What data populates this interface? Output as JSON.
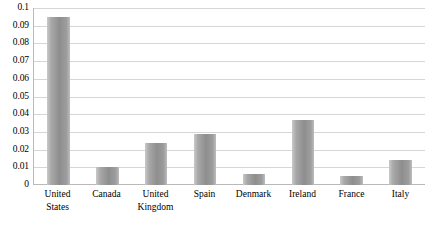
{
  "chart_data": {
    "type": "bar",
    "title": "",
    "subtitle": "",
    "xlabel": "",
    "ylabel": "",
    "categories": [
      "United States",
      "Canada",
      "United Kingdom",
      "Spain",
      "Denmark",
      "Ireland",
      "France",
      "Italy"
    ],
    "values": [
      0.095,
      0.01,
      0.024,
      0.029,
      0.006,
      0.037,
      0.005,
      0.014
    ],
    "series": [
      {
        "name": "Value",
        "values": [
          0.095,
          0.01,
          0.024,
          0.029,
          0.006,
          0.037,
          0.005,
          0.014
        ]
      }
    ],
    "ylim": [
      0,
      0.1
    ],
    "ytick_values": [
      0,
      0.01,
      0.02,
      0.03,
      0.04,
      0.05,
      0.06,
      0.07,
      0.08,
      0.09,
      0.1
    ],
    "ytick_labels": [
      "0",
      "0.01",
      "0.02",
      "0.03",
      "0.04",
      "0.05",
      "0.06",
      "0.07",
      "0.08",
      "0.09",
      "0.1"
    ],
    "grid": true,
    "grid_axis": "y",
    "legend": false,
    "legend_position": "none",
    "annotations": [],
    "colors": {
      "bar_light": "#c9c9c9",
      "bar_mid": "#8e8e8e",
      "bar_edge": "#bdbdbd",
      "gridline": "#d6d6d6",
      "axis_line": "#b9b9b9",
      "text": "#000000",
      "background": "#ffffff"
    }
  }
}
